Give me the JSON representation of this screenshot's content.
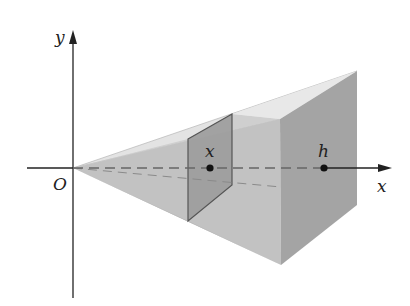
{
  "figure": {
    "labels": {
      "y_axis": "y",
      "x_axis": "x",
      "origin": "O",
      "cross_section_point": "x",
      "height_point": "h"
    },
    "colors": {
      "top_face": "#e3e3e3",
      "left_face": "#c9c9c9",
      "bottom_face": "#b8b8b8",
      "front_face": "#a3a3a3",
      "cross_section": "#9d9d9d",
      "axis": "#222222",
      "dashed_axis": "#6b6b6b"
    }
  }
}
